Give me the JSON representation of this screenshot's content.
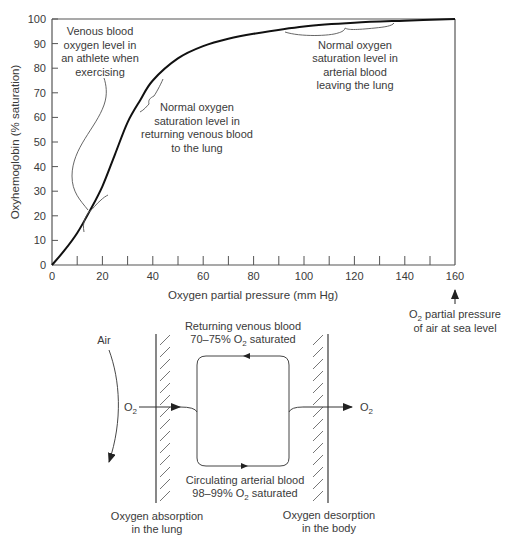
{
  "chart_data": {
    "type": "line",
    "title": "",
    "xlabel": "Oxygen partial pressure (mm Hg)",
    "ylabel": "Oxyhemoglobin (% saturation)",
    "xlim": [
      0,
      160
    ],
    "ylim": [
      0,
      100
    ],
    "x_ticks": [
      "0",
      "20",
      "40",
      "60",
      "80",
      "100",
      "120",
      "140",
      "160"
    ],
    "y_ticks": [
      "0",
      "10",
      "20",
      "30",
      "40",
      "50",
      "60",
      "70",
      "80",
      "90",
      "100"
    ],
    "grid": false,
    "series": [
      {
        "name": "Oxyhemoglobin dissociation curve",
        "x": [
          0,
          5,
          10,
          15,
          20,
          25,
          30,
          35,
          40,
          50,
          60,
          70,
          80,
          100,
          120,
          140,
          160
        ],
        "values": [
          0,
          6,
          13,
          22,
          32,
          45,
          58,
          67,
          75,
          84,
          89,
          92,
          94,
          97,
          98.5,
          99.3,
          100
        ]
      }
    ],
    "annotations": [
      {
        "id": "athlete",
        "text": [
          "Venous blood",
          "oxygen level in",
          "an athlete when",
          "exercising"
        ],
        "x_range": [
          12,
          22
        ],
        "y_range": [
          15,
          34
        ]
      },
      {
        "id": "venous",
        "text": [
          "Normal oxygen",
          "saturation level in",
          "returning venous blood",
          "to the lung"
        ],
        "x_range": [
          30,
          40
        ],
        "y_range": [
          60,
          74
        ]
      },
      {
        "id": "arterial",
        "text": [
          "Normal oxygen",
          "saturation level in",
          "arterial blood",
          "leaving the lung"
        ],
        "x_range": [
          95,
          137
        ],
        "y_range": [
          97,
          99
        ]
      },
      {
        "id": "sea-level",
        "text": [
          "O₂ partial pressure",
          "of air at sea level"
        ],
        "x": 160
      }
    ]
  },
  "chart": {
    "ylabel": "Oxyhemoglobin (% saturation)",
    "xlabel": "Oxygen partial pressure (mm Hg)",
    "x_ticks": [
      "0",
      "20",
      "40",
      "60",
      "80",
      "100",
      "120",
      "140",
      "160"
    ],
    "y_ticks": [
      "0",
      "10",
      "20",
      "30",
      "40",
      "50",
      "60",
      "70",
      "80",
      "90",
      "100"
    ],
    "notes": {
      "athlete": [
        "Venous blood",
        "oxygen level in",
        "an athlete when",
        "exercising"
      ],
      "venous": [
        "Normal oxygen",
        "saturation level in",
        "returning venous blood",
        "to the lung"
      ],
      "arterial": [
        "Normal oxygen",
        "saturation level in",
        "arterial blood",
        "leaving the lung"
      ],
      "sea_level": {
        "line1_prefix": "O",
        "line1_sub": "2",
        "line1_suffix": " partial pressure",
        "line2": "of air at sea level"
      }
    }
  },
  "diagram": {
    "air_label": "Air",
    "o2_in": {
      "main": "O",
      "sub": "2"
    },
    "o2_out": {
      "main": "O",
      "sub": "2"
    },
    "top_label": {
      "line1": "Returning venous blood",
      "line2_prefix": "70–75% O",
      "line2_sub": "2",
      "line2_suffix": " saturated"
    },
    "bottom_label": {
      "line1": "Circulating arterial blood",
      "line2_prefix": "98–99% O",
      "line2_sub": "2",
      "line2_suffix": " saturated"
    },
    "lung_label": {
      "line1": "Oxygen absorption",
      "line2": "in the lung"
    },
    "body_label": {
      "line1": "Oxygen desorption",
      "line2": "in the body"
    }
  }
}
